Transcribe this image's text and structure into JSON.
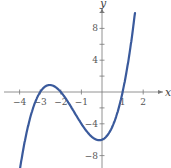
{
  "chart_data": {
    "type": "line",
    "title": "",
    "xlabel": "x",
    "ylabel": "y",
    "function": "y = x^3 + 4x^2 + x - 6",
    "x_ticks": [
      -4,
      -3,
      -2,
      -1,
      1,
      2
    ],
    "y_ticks": [
      8,
      4,
      -4,
      -8
    ],
    "x_tick_labels": [
      "-4",
      "-3",
      "-2",
      "-1",
      "1",
      "2"
    ],
    "y_tick_labels": [
      "8",
      "4",
      "-4",
      "-8"
    ],
    "xlim": [
      -4.8,
      2.9
    ],
    "ylim": [
      -9.5,
      11
    ],
    "grid": false,
    "series": [
      {
        "name": "curve",
        "color": "#3a5a9c",
        "x": [
          -4.0,
          -3.5,
          -3.0,
          -2.5,
          -2.0,
          -1.5,
          -1.0,
          -0.5,
          0.0,
          0.5,
          1.0,
          1.5,
          1.6
        ],
        "y": [
          -10,
          -3.1,
          0,
          0.9,
          0,
          -1.9,
          -4,
          -5.6,
          -6,
          -4.9,
          0,
          5.6,
          9.9
        ]
      }
    ],
    "zeros": [
      -3,
      -2,
      1
    ],
    "y_intercept": -6
  }
}
